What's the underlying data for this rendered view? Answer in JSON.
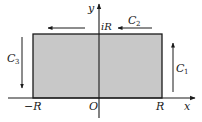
{
  "diagram": {
    "colors": {
      "fill": "#c8c8c8",
      "stroke": "#1a1a1a",
      "background": "#ffffff"
    },
    "axes": {
      "x_label": "x",
      "y_label": "y",
      "origin_label": "O"
    },
    "tick_labels": {
      "neg_R": "−R",
      "pos_R": "R",
      "iR": "iR"
    },
    "contours": {
      "c1": {
        "letter": "C",
        "sub": "1",
        "direction": "up"
      },
      "c2": {
        "letter": "C",
        "sub": "2",
        "direction": "left"
      },
      "c3": {
        "letter": "C",
        "sub": "3",
        "direction": "down"
      }
    }
  }
}
